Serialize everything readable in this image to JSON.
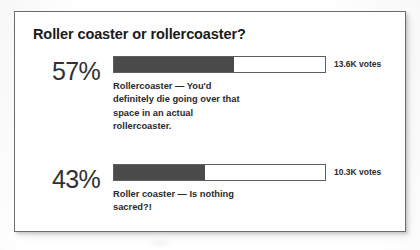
{
  "poll": {
    "title": "Roller coaster or rollercoaster?",
    "options": [
      {
        "percent": "57%",
        "percent_value": 57,
        "votes": "13.6K votes",
        "answer": "Rollercoaster — You'd definitely die going over that space in an actual rollercoaster."
      },
      {
        "percent": "43%",
        "percent_value": 43,
        "votes": "10.3K votes",
        "answer": "Roller coaster — Is nothing sacred?!"
      }
    ]
  },
  "chart_data": {
    "type": "bar",
    "title": "Roller coaster or rollercoaster?",
    "categories": [
      "Rollercoaster — You'd definitely die going over that space in an actual rollercoaster.",
      "Roller coaster — Is nothing sacred?!"
    ],
    "values": [
      57,
      43
    ],
    "value_labels": [
      "57%",
      "43%"
    ],
    "annotations": [
      "13.6K votes",
      "10.3K votes"
    ],
    "xlabel": "",
    "ylabel": "",
    "xlim": [
      0,
      100
    ],
    "grid": false,
    "legend": "none",
    "orientation": "horizontal",
    "colors": {
      "fill": "#4b4b4b",
      "track": "#ffffff",
      "track_border": "#5d5d5d",
      "text": "#2b2b2b"
    }
  }
}
